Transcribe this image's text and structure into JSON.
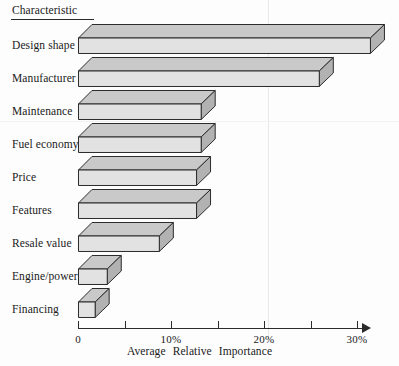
{
  "header": {
    "title": "Characteristic"
  },
  "axis": {
    "x_title": "Average Relative Importance",
    "ticks": [
      {
        "value": 0,
        "label": "0"
      },
      {
        "value": 5,
        "label": ""
      },
      {
        "value": 10,
        "label": "10%"
      },
      {
        "value": 15,
        "label": ""
      },
      {
        "value": 20,
        "label": "20%"
      },
      {
        "value": 25,
        "label": ""
      },
      {
        "value": 30,
        "label": "30%"
      }
    ]
  },
  "colors": {
    "front_face": "#e2e2e2",
    "top_face": "#c9c9c9",
    "side_face": "#b2b2b2",
    "outline": "#2b2b2b",
    "text": "#1a1a1a",
    "background": "#fdfdfd"
  },
  "chart_data": {
    "type": "bar",
    "orientation": "horizontal",
    "style": "3d-blocks",
    "title": "Characteristic",
    "xlabel": "Average Relative Importance",
    "ylabel": "Characteristic",
    "xlim": [
      0,
      31
    ],
    "xunit": "%",
    "grid": false,
    "legend": "none",
    "categories": [
      "Design shape",
      "Manufacturer",
      "Maintenance",
      "Fuel economy",
      "Price",
      "Features",
      "Resale value",
      "Engine/power",
      "Financing"
    ],
    "values": [
      31.5,
      26.0,
      13.3,
      13.3,
      12.8,
      12.8,
      8.8,
      3.2,
      1.9
    ],
    "series": [
      {
        "name": "Average Relative Importance",
        "values": [
          31.5,
          26.0,
          13.3,
          13.3,
          12.8,
          12.8,
          8.8,
          3.2,
          1.9
        ]
      }
    ]
  }
}
